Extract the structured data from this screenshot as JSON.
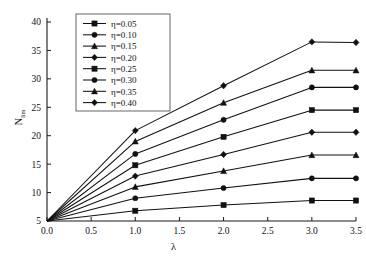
{
  "chart_data": {
    "type": "line",
    "title": "",
    "xlabel": "λ",
    "ylabel": "N'_lim",
    "ylabel_base": "N",
    "ylabel_sub": "lim",
    "xlim": [
      0.0,
      3.5
    ],
    "ylim": [
      5,
      40
    ],
    "grid": false,
    "legend_position": "upper-left-inside",
    "xticks": [
      "0.0",
      "0.5",
      "1.0",
      "1.5",
      "2.0",
      "2.5",
      "3.0",
      "3.5"
    ],
    "xtick_values": [
      0.0,
      0.5,
      1.0,
      1.5,
      2.0,
      2.5,
      3.0,
      3.5
    ],
    "yticks": [
      "5",
      "10",
      "15",
      "20",
      "25",
      "30",
      "35",
      "40"
    ],
    "ytick_values": [
      5,
      10,
      15,
      20,
      25,
      30,
      35,
      40
    ],
    "x": [
      0.0,
      1.0,
      2.0,
      3.0,
      3.5
    ],
    "series": [
      {
        "name": "η=0.05",
        "marker": "square",
        "values": [
          5.0,
          6.8,
          7.8,
          8.6,
          8.6
        ]
      },
      {
        "name": "η=0.10",
        "marker": "circle",
        "values": [
          5.0,
          9.0,
          10.8,
          12.5,
          12.5
        ]
      },
      {
        "name": "η=0.15",
        "marker": "triangle",
        "values": [
          5.0,
          11.0,
          13.8,
          16.6,
          16.6
        ]
      },
      {
        "name": "η=0.20",
        "marker": "diamond",
        "values": [
          5.0,
          12.9,
          16.7,
          20.6,
          20.6
        ]
      },
      {
        "name": "η=0.25",
        "marker": "square",
        "values": [
          5.0,
          14.8,
          19.8,
          24.5,
          24.5
        ]
      },
      {
        "name": "η=0.30",
        "marker": "circle",
        "values": [
          5.0,
          16.8,
          22.8,
          28.5,
          28.5
        ]
      },
      {
        "name": "η=0.35",
        "marker": "triangle",
        "values": [
          5.0,
          19.0,
          25.8,
          31.5,
          31.5
        ]
      },
      {
        "name": "η=0.40",
        "marker": "diamond",
        "values": [
          5.0,
          20.9,
          28.8,
          36.5,
          36.4
        ]
      }
    ]
  },
  "legend": {
    "entries": [
      {
        "label": "η=0.05"
      },
      {
        "label": "η=0.10"
      },
      {
        "label": "η=0.15"
      },
      {
        "label": "η=0.20"
      },
      {
        "label": "η=0.25"
      },
      {
        "label": "η=0.30"
      },
      {
        "label": "η=0.35"
      },
      {
        "label": "η=0.40"
      }
    ]
  },
  "colors": {
    "ink": "#111111",
    "axis": "#1a1a1a",
    "legend_border": "#555555",
    "background": "#ffffff"
  }
}
